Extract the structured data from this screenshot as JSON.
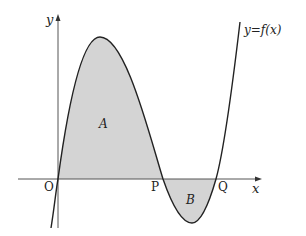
{
  "figure": {
    "type": "function-graph",
    "curve_label": "y=f(x)",
    "axes": {
      "x_label": "x",
      "y_label": "y",
      "origin_label": "O"
    },
    "points": [
      {
        "name": "O",
        "label": "O"
      },
      {
        "name": "P",
        "label": "P"
      },
      {
        "name": "Q",
        "label": "Q"
      }
    ],
    "regions": [
      {
        "name": "A",
        "label": "A",
        "between": "O and P",
        "position": "above x-axis"
      },
      {
        "name": "B",
        "label": "B",
        "between": "P and Q",
        "position": "below x-axis"
      }
    ],
    "colors": {
      "curve": "#222222",
      "axis": "#555555",
      "shade": "#d4d4d4"
    }
  }
}
